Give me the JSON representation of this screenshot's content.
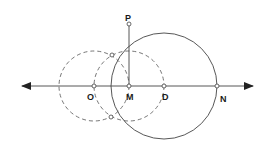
{
  "diagram": {
    "type": "geometric-construction",
    "colors": {
      "stroke": "#444444",
      "dashed": "#666666",
      "point_fill": "#ffffff",
      "label": "#1a1a1a",
      "background": "#ffffff"
    },
    "line": {
      "x1": 22,
      "y1": 86,
      "x2": 253,
      "y2": 86,
      "arrows": "both"
    },
    "points": [
      {
        "id": "O",
        "label": "O",
        "x": 94,
        "y": 86,
        "label_x": 87,
        "label_y": 100
      },
      {
        "id": "M",
        "label": "M",
        "x": 129,
        "y": 86,
        "label_x": 126,
        "label_y": 100
      },
      {
        "id": "D",
        "label": "D",
        "x": 164,
        "y": 86,
        "label_x": 162,
        "label_y": 100
      },
      {
        "id": "N",
        "label": "N",
        "x": 217,
        "y": 86,
        "label_x": 220,
        "label_y": 102
      },
      {
        "id": "P",
        "label": "P",
        "x": 129,
        "y": 24,
        "label_x": 125,
        "label_y": 21
      },
      {
        "id": "I1",
        "label": "",
        "x": 112,
        "y": 55
      },
      {
        "id": "I2",
        "label": "",
        "x": 111,
        "y": 117
      }
    ],
    "segments": [
      {
        "from": "M",
        "to": "P",
        "style": "solid"
      }
    ],
    "circles": [
      {
        "id": "circle-D",
        "center": "D",
        "cx": 164,
        "cy": 86,
        "r": 53,
        "style": "solid"
      },
      {
        "id": "circle-O",
        "center": "O",
        "cx": 94,
        "cy": 86,
        "r": 35,
        "style": "dashed"
      },
      {
        "id": "circle-M",
        "center": "M",
        "cx": 129,
        "cy": 86,
        "r": 35,
        "style": "dashed"
      }
    ]
  }
}
